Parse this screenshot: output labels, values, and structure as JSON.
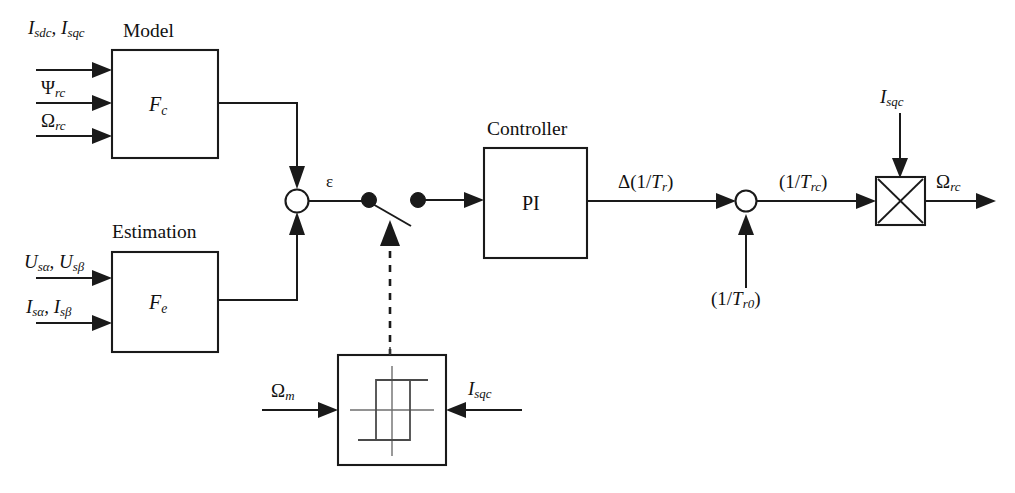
{
  "figure": {
    "type": "block-diagram",
    "background_color": "#ffffff",
    "line_color": "#1a1a1a"
  },
  "blocks": {
    "model": {
      "caption": "Model",
      "symbol_base": "F",
      "symbol_sub": "c",
      "symbol": "Fc"
    },
    "estimation": {
      "caption": "Estimation",
      "symbol_base": "F",
      "symbol_sub": "e",
      "symbol": "Fe"
    },
    "controller": {
      "caption": "Controller",
      "symbol": "PI"
    },
    "hysteresis": {
      "caption": "",
      "symbol": "hysteresis-relay"
    },
    "multiplier": {
      "caption": "",
      "symbol": "multiply-cross"
    }
  },
  "inputs": {
    "model": [
      {
        "base": "I",
        "sub": "sdc",
        "base2": "I",
        "sub2": "sqc",
        "text": "Isdc, Isqc"
      },
      {
        "base": "Ψ",
        "sub": "rc",
        "text": "Ψrc"
      },
      {
        "base": "Ω",
        "sub": "rc",
        "text": "Ωrc"
      }
    ],
    "estimation": [
      {
        "base": "U",
        "sub": "sα",
        "base2": "U",
        "sub2": "sβ",
        "text": "Usα, Usβ"
      },
      {
        "base": "I",
        "sub": "sα",
        "base2": "I",
        "sub2": "sβ",
        "text": "Isα, Isβ"
      }
    ],
    "hysteresis_left": {
      "base": "Ω",
      "sub": "m",
      "text": "Ωm"
    },
    "hysteresis_right": {
      "base": "I",
      "sub": "sqc",
      "text": "Isqc"
    },
    "multiplier_top": {
      "base": "I",
      "sub": "sqc",
      "text": "Isqc"
    },
    "summer2_bottom": {
      "text": "(1/Tr0)",
      "prefix": "(1/",
      "base": "T",
      "sub": "r0",
      "suffix": ")"
    }
  },
  "signals": {
    "error": {
      "text": "ε",
      "name": "epsilon"
    },
    "pi_output": {
      "prefix": "Δ(1/",
      "base": "T",
      "sub": "r",
      "suffix": ")",
      "text": "Δ(1/Tr)"
    },
    "summer2_output": {
      "prefix": "(1/",
      "base": "T",
      "sub": "rc",
      "suffix": ")",
      "text": "(1/Trc)"
    },
    "final_output": {
      "base": "Ω",
      "sub": "rc",
      "text": "Ωrc"
    }
  },
  "elements": {
    "summing_junction_1": {
      "name": "error-summing-junction",
      "shape": "circle-open"
    },
    "summing_junction_2": {
      "name": "offset-summing-junction",
      "shape": "circle-open"
    },
    "switch": {
      "name": "signal-switch",
      "state": "open",
      "node_left": "filled-dot",
      "node_right": "filled-dot"
    },
    "control_link": {
      "name": "switch-control-dashed-link",
      "style": "dashed"
    }
  }
}
